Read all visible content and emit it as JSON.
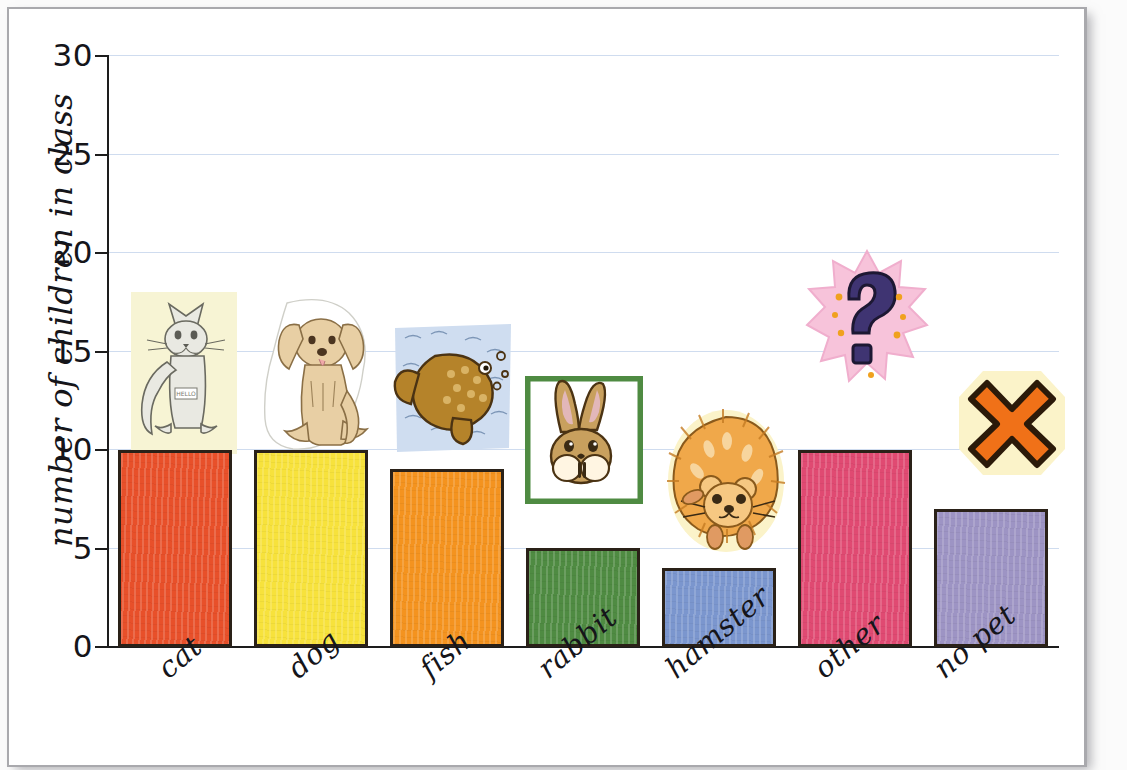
{
  "chart_data": {
    "type": "bar",
    "title": "",
    "xlabel": "",
    "ylabel": "number of children in class",
    "ylim": [
      0,
      30
    ],
    "ytick_values": [
      0,
      5,
      10,
      15,
      20,
      25,
      30
    ],
    "ytick_labels": [
      "0",
      "5",
      "10",
      "15",
      "20",
      "25",
      "30"
    ],
    "grid": "horizontal",
    "legend": "none",
    "categories": [
      "cat",
      "dog",
      "fish",
      "rabbit",
      "hamster",
      "other",
      "no pet"
    ],
    "values": [
      10,
      10,
      9,
      5,
      4,
      10,
      7
    ],
    "bar_colors": [
      "#E8502A",
      "#F7E23C",
      "#F4931F",
      "#4F8B42",
      "#7B96CE",
      "#E04A72",
      "#9D94C4"
    ],
    "bar_outline_color": "#2A2118",
    "gridline_color": "#CFDCEF",
    "axis_color": "#1D1D1D",
    "icons": [
      "cat-illustration",
      "dog-illustration",
      "fish-illustration",
      "rabbit-illustration",
      "hamster-illustration",
      "question-mark-illustration",
      "red-cross-illustration"
    ]
  },
  "axis": {
    "y_title": "number of children in class"
  },
  "ticks": {
    "t0": "0",
    "t5": "5",
    "t10": "10",
    "t15": "15",
    "t20": "20",
    "t25": "25",
    "t30": "30"
  },
  "categories": {
    "c0": "cat",
    "c1": "dog",
    "c2": "fish",
    "c3": "rabbit",
    "c4": "hamster",
    "c5": "other",
    "c6": "no pet"
  }
}
